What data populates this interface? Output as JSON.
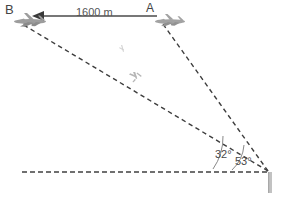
{
  "diagram": {
    "labels": {
      "plane_b": "B",
      "plane_a": "A",
      "distance": "1600 m",
      "angle_near": "32°",
      "angle_far": "53°"
    },
    "colors": {
      "line": "#3f3f3f",
      "dash": "#404040",
      "plane": "#9a9a9a",
      "tower": "#bdbdbd",
      "text": "#444444",
      "arc": "#6e6e6e",
      "background": "#ffffff"
    },
    "geometry": {
      "observer": {
        "x": 270,
        "y": 172
      },
      "plane_b_point": {
        "x": 22,
        "y": 22
      },
      "plane_a_point": {
        "x": 163,
        "y": 22
      },
      "ground_line": {
        "x1": 22,
        "x2": 268,
        "y": 172
      },
      "distance_arrow": {
        "x_from": 156,
        "x_to": 38,
        "y": 16
      }
    },
    "icons": {
      "plane_b": "airplane-icon",
      "plane_a": "airplane-icon",
      "plane_small": "airplane-icon",
      "tower": "tower-icon",
      "arrow": "arrow-left-icon"
    }
  }
}
